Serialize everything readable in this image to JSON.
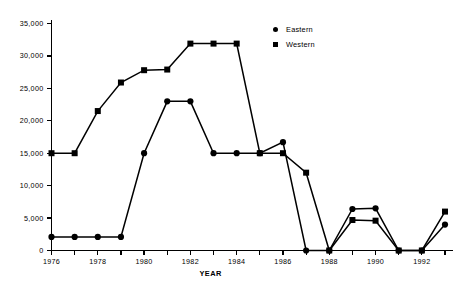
{
  "chart_data": {
    "type": "line",
    "title": "",
    "subtitle": "",
    "xlabel": "YEAR",
    "ylabel": "",
    "x": [
      1976,
      1977,
      1978,
      1979,
      1980,
      1981,
      1982,
      1983,
      1984,
      1985,
      1986,
      1987,
      1988,
      1989,
      1990,
      1991,
      1992,
      1993
    ],
    "xlim": [
      1976,
      1993
    ],
    "ylim": [
      0,
      35000
    ],
    "grid": false,
    "legend_position": "top-right",
    "x_tick_labels": [
      "1976",
      "1978",
      "1980",
      "1982",
      "1984",
      "1986",
      "1988",
      "1990",
      "1992"
    ],
    "x_tick_values": [
      1976,
      1978,
      1980,
      1982,
      1984,
      1986,
      1988,
      1990,
      1992
    ],
    "x_minor_tick_values": [
      1977,
      1979,
      1981,
      1983,
      1985,
      1987,
      1989,
      1991,
      1993
    ],
    "y_tick_labels": [
      "0",
      "5,000",
      "10,000",
      "15,000",
      "20,000",
      "25,000",
      "30,000",
      "35,000"
    ],
    "y_tick_values": [
      0,
      5000,
      10000,
      15000,
      20000,
      25000,
      30000,
      35000
    ],
    "series": [
      {
        "name": "Eastern",
        "marker": "circle",
        "color": "#000000",
        "values": [
          2100,
          2100,
          2100,
          2100,
          15000,
          23000,
          23000,
          15000,
          15000,
          15000,
          16700,
          0,
          0,
          6400,
          6500,
          0,
          0,
          4000
        ]
      },
      {
        "name": "Western",
        "marker": "square",
        "color": "#000000",
        "values": [
          15000,
          15000,
          21500,
          25900,
          27800,
          27900,
          31900,
          31900,
          31900,
          15000,
          15000,
          12000,
          0,
          4700,
          4600,
          0,
          0,
          6000
        ]
      }
    ]
  },
  "legend": {
    "items": [
      {
        "label": "Eastern",
        "marker": "circle"
      },
      {
        "label": "Western",
        "marker": "square"
      }
    ]
  },
  "axes": {
    "x_title": "YEAR"
  }
}
